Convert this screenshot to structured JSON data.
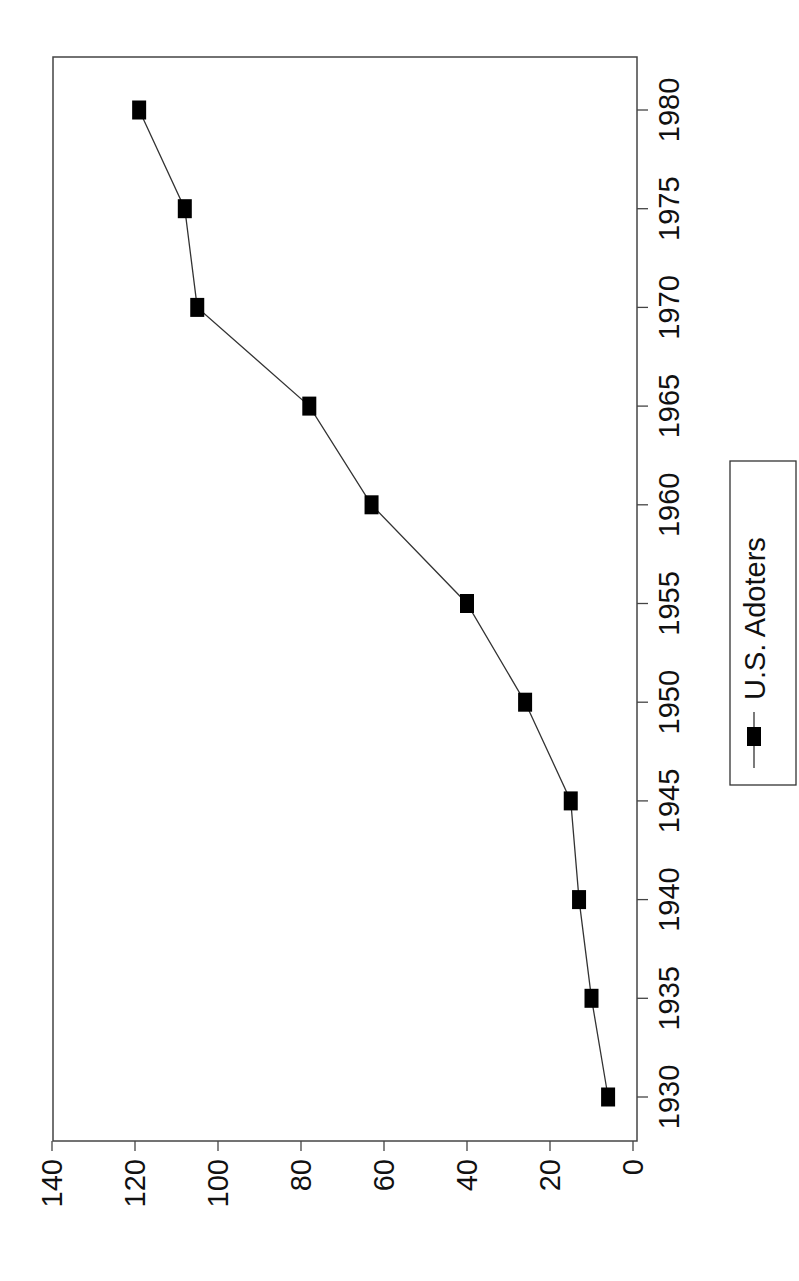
{
  "chart_data": {
    "type": "line",
    "title": "",
    "xlabel": "",
    "ylabel": "",
    "orientation": "rotated 90° (x-axis runs vertically along the right edge, y-axis runs horizontally along the bottom)",
    "x": [
      1930,
      1935,
      1940,
      1945,
      1950,
      1955,
      1960,
      1965,
      1970,
      1975,
      1980
    ],
    "series": [
      {
        "name": "U.S. Adoters",
        "marker": "square",
        "color": "#000000",
        "values": [
          6,
          10,
          13,
          15,
          26,
          40,
          63,
          78,
          105,
          108,
          119
        ]
      }
    ],
    "x_ticks": [
      "1930",
      "1935",
      "1940",
      "1945",
      "1950",
      "1955",
      "1960",
      "1965",
      "1970",
      "1975",
      "1980"
    ],
    "y_ticks": [
      "0",
      "20",
      "40",
      "60",
      "80",
      "100",
      "120",
      "140"
    ],
    "xlim": [
      1930,
      1980
    ],
    "ylim": [
      0,
      140
    ],
    "grid": false,
    "legend_position": "right, beside x-axis labels"
  },
  "legend": {
    "label": "U.S. Adoters"
  }
}
